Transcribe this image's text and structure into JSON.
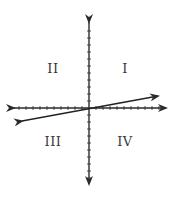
{
  "diagram": {
    "type": "coordinate-plane",
    "colors": {
      "axis": "#2b2b2b",
      "line": "#222222",
      "label": "#3a3a3a",
      "background": "#ffffff"
    },
    "origin": {
      "x": 89,
      "y": 108
    },
    "tick_spacing_px": 7,
    "ticks_per_half_axis": 10,
    "quadrants": [
      {
        "id": "I",
        "label": "I",
        "x": 125,
        "y": 68
      },
      {
        "id": "II",
        "label": "II",
        "x": 53,
        "y": 68
      },
      {
        "id": "III",
        "label": "III",
        "x": 53,
        "y": 141
      },
      {
        "id": "IV",
        "label": "IV",
        "x": 125,
        "y": 141
      }
    ],
    "line": {
      "description": "line through origin with small positive slope, arrows both ends",
      "from": {
        "x": 20,
        "y": 121
      },
      "to": {
        "x": 160,
        "y": 96
      }
    }
  }
}
